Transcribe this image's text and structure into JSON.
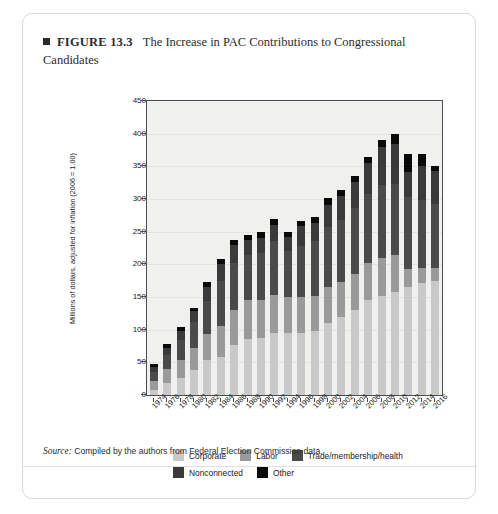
{
  "figure": {
    "marker": "square-bullet",
    "number": "FIGURE 13.3",
    "title": "The Increase in PAC Contributions to Congressional Candidates"
  },
  "source": {
    "label": "Source:",
    "text": "Compiled by the authors from Federal Election Commission data."
  },
  "legend": {
    "position": "bottom",
    "rows": [
      [
        {
          "label": "Corporate",
          "color": "#c9c9c9"
        },
        {
          "label": "Labor",
          "color": "#9a9a9a"
        },
        {
          "label": "Trade/membership/health",
          "color": "#4a4a4a"
        }
      ],
      [
        {
          "label": "Nonconnected",
          "color": "#3a3a3a"
        },
        {
          "label": "Other",
          "color": "#0a0a0a"
        }
      ]
    ]
  },
  "chart_data": {
    "type": "bar",
    "stacked": true,
    "title": "The Increase in PAC Contributions to Congressional Candidates",
    "xlabel": "",
    "ylabel": "Millions of dollars, adjusted for inflation (2006 = 1.00)",
    "ylim": [
      0,
      450
    ],
    "yticks": [
      0,
      50,
      100,
      150,
      200,
      250,
      300,
      350,
      400,
      450
    ],
    "grid": true,
    "categories": [
      "1974",
      "1976",
      "1978",
      "1980",
      "1982",
      "1984",
      "1986",
      "1988",
      "1990",
      "1992",
      "1994",
      "1996",
      "1998",
      "2000",
      "2002",
      "2004",
      "2006",
      "2008",
      "2010",
      "2012",
      "2014",
      "2016"
    ],
    "series": [
      {
        "name": "Corporate",
        "color": "#c9c9c9",
        "values": [
          8,
          18,
          26,
          38,
          54,
          58,
          76,
          85,
          88,
          95,
          95,
          95,
          98,
          110,
          120,
          130,
          145,
          152,
          158,
          165,
          172,
          175
        ]
      },
      {
        "name": "Labor",
        "color": "#9a9a9a",
        "values": [
          14,
          22,
          28,
          34,
          40,
          48,
          54,
          60,
          57,
          58,
          55,
          55,
          53,
          55,
          53,
          56,
          57,
          58,
          57,
          28,
          22,
          20
        ]
      },
      {
        "name": "Trade/membership/health",
        "color": "#4a4a4a",
        "values": [
          13,
          22,
          30,
          40,
          50,
          68,
          72,
          70,
          72,
          82,
          70,
          78,
          85,
          92,
          95,
          100,
          105,
          112,
          108,
          110,
          105,
          98
        ]
      },
      {
        "name": "Nonconnected",
        "color": "#3a3a3a",
        "values": [
          8,
          10,
          14,
          16,
          22,
          26,
          27,
          22,
          24,
          26,
          22,
          30,
          28,
          34,
          36,
          40,
          48,
          58,
          62,
          38,
          52,
          50
        ]
      },
      {
        "name": "Other",
        "color": "#0a0a0a",
        "values": [
          5,
          6,
          6,
          6,
          7,
          8,
          9,
          8,
          8,
          9,
          8,
          9,
          9,
          10,
          10,
          10,
          10,
          10,
          15,
          28,
          18,
          8
        ]
      }
    ],
    "totals": [
      48,
      78,
      104,
      134,
      173,
      208,
      238,
      245,
      249,
      270,
      250,
      267,
      273,
      301,
      314,
      336,
      365,
      390,
      400,
      369,
      369,
      351
    ]
  }
}
